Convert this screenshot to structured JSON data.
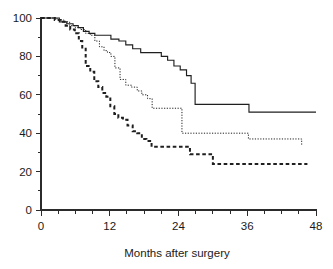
{
  "chart_data": {
    "type": "line",
    "title": "",
    "subtitle": "",
    "xlabel": "Months after surgery",
    "ylabel": "",
    "xlim": [
      0,
      48
    ],
    "ylim": [
      0,
      100
    ],
    "grid": false,
    "legend_position": "none",
    "x_ticks_major": [
      0,
      12,
      24,
      36,
      48
    ],
    "x_tick_labels": [
      "0",
      "12",
      "24",
      "36",
      "48"
    ],
    "x_ticks_minor_step": 3,
    "y_ticks_major": [
      0,
      20,
      40,
      60,
      80,
      100
    ],
    "y_tick_labels": [
      "0",
      "20",
      "40",
      "60",
      "80",
      "100"
    ],
    "y_ticks_minor_step": 10,
    "step_type": "post",
    "series": [
      {
        "name": "curve-solid",
        "style": "solid",
        "color": "#1f1f1f",
        "final_value": 51,
        "x": [
          0,
          1.5,
          3.2,
          4.5,
          5.6,
          6.5,
          7.4,
          8.4,
          9.4,
          10.4,
          12.2,
          13.6,
          14.8,
          16.0,
          17.4,
          19.2,
          21.0,
          22.1,
          23.2,
          24.3,
          25.4,
          26.2,
          26.9,
          30.0,
          36.3,
          48
        ],
        "y": [
          100,
          100,
          98,
          97,
          96,
          95,
          93,
          92,
          91,
          91,
          89,
          88,
          86,
          84,
          82,
          82,
          80,
          78,
          75,
          73,
          70,
          66,
          55,
          55,
          51,
          51
        ]
      },
      {
        "name": "curve-dotted",
        "style": "dotted",
        "color": "#1f1f1f",
        "final_value": 34,
        "x": [
          0,
          1.4,
          2.8,
          4.0,
          5.0,
          6.0,
          6.9,
          7.8,
          8.6,
          9.4,
          10.2,
          11.0,
          11.6,
          12.2,
          12.9,
          13.8,
          14.8,
          15.8,
          16.8,
          17.6,
          18.6,
          19.4,
          24.6,
          26.6,
          36.2,
          45.5
        ],
        "y": [
          100,
          100,
          99,
          98,
          96,
          95,
          94,
          92,
          91,
          88,
          85,
          83,
          82,
          80,
          74,
          68,
          65,
          64,
          62,
          60,
          58,
          53,
          40,
          40,
          37,
          34
        ]
      },
      {
        "name": "curve-dashed",
        "style": "dashed",
        "color": "#1f1f1f",
        "final_value": 24,
        "x": [
          0,
          1.2,
          2.4,
          3.4,
          4.3,
          5.1,
          5.9,
          6.6,
          7.2,
          7.8,
          8.6,
          9.3,
          10.0,
          10.7,
          11.4,
          12.1,
          12.8,
          13.5,
          14.3,
          15.1,
          16.0,
          16.8,
          17.6,
          18.4,
          19.3,
          24.3,
          26.0,
          27.0,
          30.0,
          46.5
        ],
        "y": [
          100,
          100,
          99,
          98,
          96,
          94,
          92,
          88,
          84,
          75,
          72,
          67,
          64,
          61,
          59,
          54,
          50,
          48,
          47,
          44,
          41,
          40,
          37,
          36,
          33,
          33,
          29,
          29,
          24,
          24
        ]
      }
    ]
  },
  "axis": {
    "x_title": "Months after surgery"
  }
}
